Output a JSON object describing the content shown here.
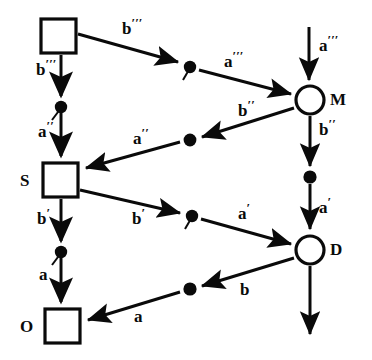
{
  "figure": {
    "kind": "commutative-diagram",
    "background_color": "#ffffff",
    "ink_color": "#0a0a0a",
    "width": 372,
    "height": 360
  },
  "nodes": [
    {
      "id": "sq-top",
      "shape": "square",
      "label": "",
      "x": 58,
      "y": 36,
      "size": 34
    },
    {
      "id": "sq-s",
      "shape": "square",
      "label": "S",
      "x": 60,
      "y": 180,
      "size": 34
    },
    {
      "id": "sq-o",
      "shape": "square",
      "label": "O",
      "x": 62,
      "y": 326,
      "size": 34
    },
    {
      "id": "circ-m",
      "shape": "circle",
      "label": "M",
      "x": 310,
      "y": 100,
      "r": 14
    },
    {
      "id": "circ-d",
      "shape": "circle",
      "label": "D",
      "x": 310,
      "y": 250,
      "r": 14
    },
    {
      "id": "dot-left-upper",
      "shape": "dot-tailed",
      "label": "",
      "x": 61,
      "y": 108
    },
    {
      "id": "dot-left-lower",
      "shape": "dot-tailed",
      "label": "",
      "x": 61,
      "y": 252
    },
    {
      "id": "dot-mid-upper",
      "shape": "dot-tailed",
      "label": "",
      "x": 190,
      "y": 67
    },
    {
      "id": "dot-mid-lower",
      "shape": "dot-tailed",
      "label": "",
      "x": 192,
      "y": 216
    },
    {
      "id": "dot-mid-b2",
      "shape": "dot",
      "label": "",
      "x": 190,
      "y": 140
    },
    {
      "id": "dot-mid-b",
      "shape": "dot",
      "label": "",
      "x": 190,
      "y": 289
    },
    {
      "id": "dot-right-upper",
      "shape": "dot",
      "label": "",
      "x": 310,
      "y": 177
    }
  ],
  "node_labels": [
    {
      "id": "label-S",
      "text": "S",
      "x": 22,
      "y": 172
    },
    {
      "id": "label-O",
      "text": "O",
      "x": 22,
      "y": 318
    },
    {
      "id": "label-M",
      "text": "M",
      "x": 330,
      "y": 92
    },
    {
      "id": "label-D",
      "text": "D",
      "x": 330,
      "y": 242
    }
  ],
  "edges": [
    {
      "id": "e-b3-diag",
      "label": "b",
      "primes": 3,
      "from": "sq-top",
      "to": "dot-mid-upper",
      "label_x": 122,
      "label_y": 16
    },
    {
      "id": "e-b3-down",
      "label": "b",
      "primes": 3,
      "from": "sq-top",
      "to": "dot-left-upper",
      "label_x": 36,
      "label_y": 56
    },
    {
      "id": "e-a3-diag",
      "label": "a",
      "primes": 3,
      "from": "dot-mid-upper",
      "to": "circ-m",
      "label_x": 225,
      "label_y": 50
    },
    {
      "id": "e-a3-down",
      "label": "a",
      "primes": 3,
      "from": "top-entry",
      "to": "circ-m",
      "label_x": 320,
      "label_y": 34
    },
    {
      "id": "e-a2-down",
      "label": "a",
      "primes": 2,
      "from": "dot-left-upper",
      "to": "sq-s",
      "label_x": 38,
      "label_y": 118
    },
    {
      "id": "e-b2-diag",
      "label": "b",
      "primes": 2,
      "from": "circ-m",
      "to": "dot-mid-b2",
      "label_x": 238,
      "label_y": 98
    },
    {
      "id": "e-a2-diag",
      "label": "a",
      "primes": 2,
      "from": "dot-mid-b2",
      "to": "sq-s",
      "label_x": 134,
      "label_y": 126
    },
    {
      "id": "e-b2-down",
      "label": "b",
      "primes": 2,
      "from": "circ-m",
      "to": "dot-right-upper",
      "label_x": 320,
      "label_y": 118
    },
    {
      "id": "e-b1-down",
      "label": "b",
      "primes": 1,
      "from": "sq-s",
      "to": "dot-left-lower",
      "label_x": 36,
      "label_y": 206
    },
    {
      "id": "e-b1-diag",
      "label": "b",
      "primes": 1,
      "from": "sq-s",
      "to": "dot-mid-lower",
      "label_x": 132,
      "label_y": 206
    },
    {
      "id": "e-a1-diag",
      "label": "a",
      "primes": 1,
      "from": "dot-mid-lower",
      "to": "circ-d",
      "label_x": 238,
      "label_y": 202
    },
    {
      "id": "e-a1-down",
      "label": "a",
      "primes": 1,
      "from": "dot-right-upper",
      "to": "circ-d",
      "label_x": 320,
      "label_y": 196
    },
    {
      "id": "e-a0-down",
      "label": "a",
      "primes": 0,
      "from": "dot-left-lower",
      "to": "sq-o",
      "label_x": 38,
      "label_y": 266
    },
    {
      "id": "e-b0-diag",
      "label": "b",
      "primes": 0,
      "from": "circ-d",
      "to": "dot-mid-b",
      "label_x": 240,
      "label_y": 282
    },
    {
      "id": "e-a0-diag",
      "label": "a",
      "primes": 0,
      "from": "dot-mid-b",
      "to": "sq-o",
      "label_x": 134,
      "label_y": 308
    },
    {
      "id": "e-d-exit",
      "label": "",
      "primes": 0,
      "from": "circ-d",
      "to": "bottom-exit",
      "label_x": 0,
      "label_y": 0
    }
  ]
}
